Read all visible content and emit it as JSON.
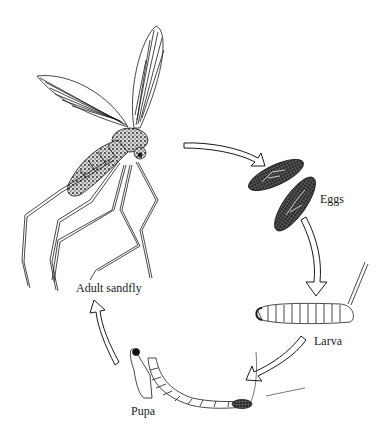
{
  "diagram": {
    "stages": [
      {
        "id": "adult",
        "label": "Adult sandfly"
      },
      {
        "id": "eggs",
        "label": "Eggs"
      },
      {
        "id": "larva",
        "label": "Larva"
      },
      {
        "id": "pupa",
        "label": "Pupa"
      }
    ],
    "arrows": [
      {
        "from": "adult",
        "to": "eggs"
      },
      {
        "from": "eggs",
        "to": "larva"
      },
      {
        "from": "larva",
        "to": "pupa"
      },
      {
        "from": "pupa",
        "to": "adult"
      }
    ],
    "colors": {
      "background": "#ffffff",
      "ink": "#1a1a1a"
    }
  }
}
